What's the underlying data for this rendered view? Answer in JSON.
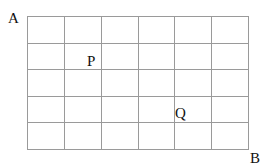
{
  "diagram": {
    "labels": {
      "A": "A",
      "B": "B",
      "P": "P",
      "Q": "Q"
    },
    "grid": {
      "columns": 6,
      "rows": 5,
      "x0": 27,
      "y0": 16,
      "x1": 248,
      "y1": 149,
      "line_color": "#9a9a9a"
    }
  }
}
